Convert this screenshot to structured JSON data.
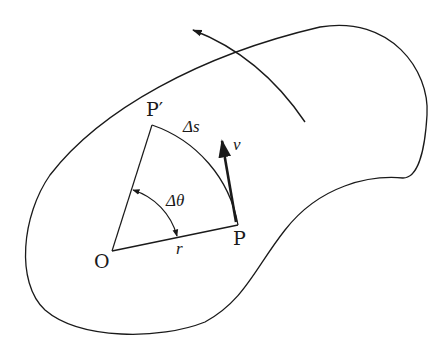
{
  "figure": {
    "stroke_color": "#1a1a1a",
    "background": "#ffffff"
  },
  "labels": {
    "origin": "O",
    "point_p": "P",
    "point_p_prime": "P′",
    "radius": "r",
    "arc_length": "Δs",
    "angle": "Δθ",
    "velocity": "v"
  },
  "geometry": {
    "O": [
      112,
      251
    ],
    "P": [
      238,
      225
    ],
    "P_prime": [
      152,
      125
    ],
    "velocity_tip": [
      222,
      140
    ],
    "motion_arrow_tip": [
      192,
      29
    ]
  }
}
